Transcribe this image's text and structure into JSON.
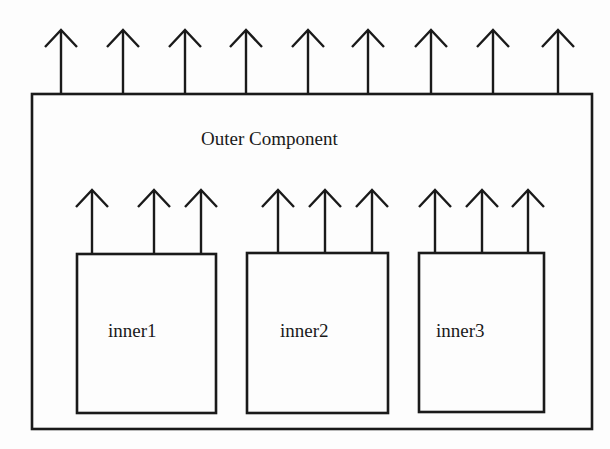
{
  "diagram": {
    "type": "component-block-diagram",
    "stroke_color": "#1a1a1a",
    "background": "#fdfdfd",
    "outer": {
      "label": "Outer Component",
      "box": {
        "x": 32,
        "y": 94,
        "w": 560,
        "h": 335
      },
      "arrows_x": [
        61,
        123,
        185,
        246,
        308,
        368,
        431,
        493,
        558
      ],
      "arrow_tip_y": 30
    },
    "inner": [
      {
        "label": "inner1",
        "box": {
          "x": 77,
          "y": 254,
          "w": 139,
          "h": 159
        },
        "label_pos": {
          "x": 108,
          "y": 320
        },
        "arrows_x": [
          92,
          154,
          201
        ],
        "arrow_tip_y": 190
      },
      {
        "label": "inner2",
        "box": {
          "x": 247,
          "y": 253,
          "w": 141,
          "h": 160
        },
        "label_pos": {
          "x": 280,
          "y": 320
        },
        "arrows_x": [
          278,
          325,
          372
        ],
        "arrow_tip_y": 190
      },
      {
        "label": "inner3",
        "box": {
          "x": 419,
          "y": 253,
          "w": 125,
          "h": 159
        },
        "label_pos": {
          "x": 436,
          "y": 320
        },
        "arrows_x": [
          435,
          482,
          528
        ],
        "arrow_tip_y": 190
      }
    ]
  }
}
